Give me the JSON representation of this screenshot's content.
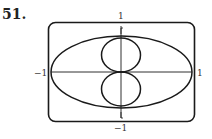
{
  "problem_number": "51.",
  "graph": {
    "x_min_label": "−1",
    "x_max_label": "1",
    "y_max_label": "1",
    "y_min_label": "−1",
    "stroke_color": "#1a1a1a",
    "frame_color": "#1a1a1a"
  }
}
